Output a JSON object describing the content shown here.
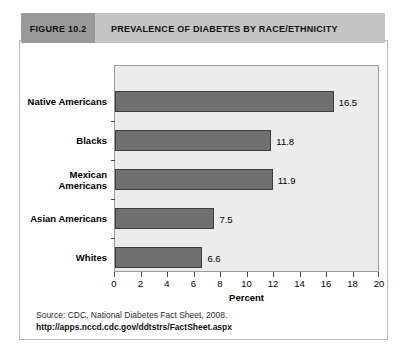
{
  "figure": {
    "number_label": "FIGURE 10.2",
    "title": "PREVALENCE OF DIABETES BY RACE/ETHNICITY",
    "source_line": "Source: CDC, National Diabetes Fact Sheet, 2008.",
    "source_url": "http://apps.nccd.cdc.gov/ddtstrs/FactSheet.aspx"
  },
  "colors": {
    "figure_number_bg": "#9a9a9a",
    "figure_title_bg": "#c4c4c4",
    "plot_bg": "#ececec",
    "bar_fill": "#707070",
    "bar_stroke": "#3d3d3d",
    "box_border": "#b9b9b9"
  },
  "chart_data": {
    "type": "bar",
    "orientation": "horizontal",
    "title": "PREVALENCE OF DIABETES BY RACE/ETHNICITY",
    "categories": [
      "Native Americans",
      "Blacks",
      "Mexican Americans",
      "Asian Americans",
      "Whites"
    ],
    "category_lines": [
      [
        "Native Americans"
      ],
      [
        "Blacks"
      ],
      [
        "Mexican",
        "Americans"
      ],
      [
        "Asian Americans"
      ],
      [
        "Whites"
      ]
    ],
    "values": [
      16.5,
      11.8,
      11.9,
      7.5,
      6.6
    ],
    "value_labels": [
      "16.5",
      "11.8",
      "11.9",
      "7.5",
      "6.6"
    ],
    "xlabel": "Percent",
    "ylabel": "",
    "xlim": [
      0,
      20
    ],
    "xticks": [
      0,
      2,
      4,
      6,
      8,
      10,
      12,
      14,
      16,
      18,
      20
    ],
    "xtick_labels": [
      "0",
      "2",
      "4",
      "6",
      "8",
      "10",
      "12",
      "14",
      "16",
      "18",
      "20"
    ],
    "grid": false,
    "legend": false
  }
}
